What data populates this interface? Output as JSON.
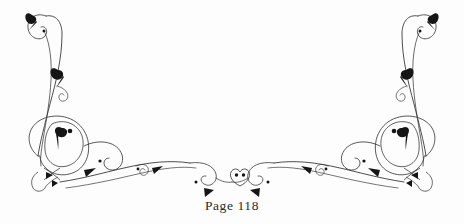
{
  "page": {
    "background_color": "#fdfdfd",
    "ink_color": "#1a1a1a",
    "stroke_color": "#3a3a3a",
    "width": 464,
    "height": 224
  },
  "footer": {
    "page_label": "Page 118",
    "page_number": 118,
    "label_prefix": "Page",
    "font_color": "#2b2b2b"
  },
  "ornament": {
    "name": "calligraphic-flourish-footer",
    "description": "Symmetrical pen-drawn scrollwork flourish forming a shallow U sweep across the lower half of the page, with tall vertical curls rising at the left and right edges.",
    "symmetry": "horizontal-mirror",
    "mirror_axis_x": 232,
    "element_counts": {
      "large_corner_curls": 2,
      "teardrop_leaves": 10,
      "triangular_leaves": 8,
      "ink_dots": 6,
      "center_medallion": 1,
      "knot_crossings": 2
    },
    "center_medallion": {
      "name": "center-heart-medallion",
      "cx": 240,
      "cy": 177,
      "width": 20,
      "height": 16,
      "dots": 2
    }
  }
}
